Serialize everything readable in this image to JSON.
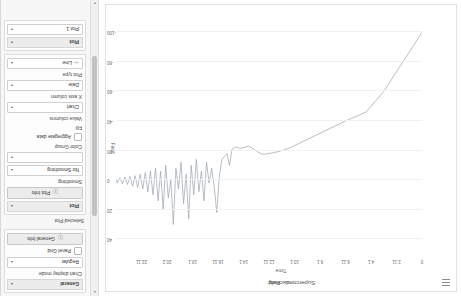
{
  "app": {
    "title": "Superconductivity"
  },
  "chart": {
    "menu_icon": "hamburger-menu-icon",
    "title": "Superconductivity",
    "legend": [
      {
        "label": "Field",
        "color": "#9aa3ad"
      }
    ],
    "xlabel": "Time",
    "ylabel": "Field"
  },
  "chart_data": {
    "type": "line",
    "title": "Superconductivity",
    "xlabel": "Time",
    "ylabel": "Field",
    "grid": true,
    "legend_position": "top-center",
    "series": [
      {
        "name": "Field",
        "color": "#9aa3ad",
        "points": [
          [
            0.0,
            -100.0
          ],
          [
            0.6,
            -92.0
          ],
          [
            1.2,
            -84.0
          ],
          [
            1.8,
            -76.0
          ],
          [
            2.4,
            -68.0
          ],
          [
            3.0,
            -60.0
          ],
          [
            3.6,
            -54.0
          ],
          [
            4.0,
            -50.0
          ],
          [
            4.4,
            -46.0
          ],
          [
            4.8,
            -44.5
          ],
          [
            5.2,
            -43.0
          ],
          [
            5.6,
            -41.5
          ],
          [
            6.0,
            -40.0
          ],
          [
            6.6,
            -37.5
          ],
          [
            7.2,
            -35.0
          ],
          [
            7.8,
            -32.5
          ],
          [
            8.4,
            -30.0
          ],
          [
            9.0,
            -27.5
          ],
          [
            9.6,
            -25.0
          ],
          [
            10.2,
            -22.5
          ],
          [
            10.8,
            -20.5
          ],
          [
            11.4,
            -19.0
          ],
          [
            12.0,
            -18.0
          ],
          [
            12.4,
            -17.5
          ],
          [
            12.8,
            -18.5
          ],
          [
            13.2,
            -21.0
          ],
          [
            13.6,
            -23.0
          ],
          [
            14.0,
            -22.0
          ],
          [
            14.3,
            -21.5
          ],
          [
            14.6,
            -22.5
          ],
          [
            14.9,
            -21.0
          ],
          [
            15.1,
            -10.0
          ],
          [
            15.3,
            -18.0
          ],
          [
            15.5,
            -16.0
          ],
          [
            15.7,
            -14.0
          ],
          [
            15.9,
            -2.0
          ],
          [
            16.1,
            22.0
          ],
          [
            16.3,
            4.0
          ],
          [
            16.5,
            -8.0
          ],
          [
            16.7,
            2.0
          ],
          [
            16.9,
            -12.0
          ],
          [
            17.1,
            14.0
          ],
          [
            17.3,
            -6.0
          ],
          [
            17.5,
            8.0
          ],
          [
            17.7,
            -14.0
          ],
          [
            17.9,
            10.0
          ],
          [
            18.1,
            -10.0
          ],
          [
            18.3,
            26.0
          ],
          [
            18.5,
            -4.0
          ],
          [
            18.7,
            16.0
          ],
          [
            18.9,
            -12.0
          ],
          [
            19.1,
            6.0
          ],
          [
            19.3,
            -8.0
          ],
          [
            19.5,
            30.0
          ],
          [
            19.7,
            0.0
          ],
          [
            19.9,
            12.0
          ],
          [
            20.1,
            -10.0
          ],
          [
            20.3,
            20.0
          ],
          [
            20.5,
            -6.0
          ],
          [
            20.7,
            14.0
          ],
          [
            20.9,
            -8.0
          ],
          [
            21.1,
            10.0
          ],
          [
            21.3,
            -6.0
          ],
          [
            21.5,
            8.0
          ],
          [
            21.7,
            -5.0
          ],
          [
            21.9,
            6.0
          ],
          [
            22.1,
            -4.0
          ],
          [
            22.3,
            5.0
          ],
          [
            22.5,
            -3.0
          ],
          [
            22.7,
            4.0
          ],
          [
            22.9,
            -2.5
          ],
          [
            23.1,
            3.0
          ],
          [
            23.3,
            -2.0
          ],
          [
            23.5,
            2.5
          ],
          [
            23.7,
            -1.5
          ],
          [
            23.9,
            2.0
          ],
          [
            24.0,
            -1.0
          ]
        ]
      }
    ],
    "xticks": [
      {
        "value": 0,
        "label": "0"
      },
      {
        "value": 2,
        "label": "2.11"
      },
      {
        "value": 4,
        "label": "4.1"
      },
      {
        "value": 6,
        "label": "6.11"
      },
      {
        "value": 8,
        "label": "8.1"
      },
      {
        "value": 10,
        "label": "10.1"
      },
      {
        "value": 12,
        "label": "12.11"
      },
      {
        "value": 14,
        "label": "14.1"
      },
      {
        "value": 16,
        "label": "16.11"
      },
      {
        "value": 18,
        "label": "18.1"
      },
      {
        "value": 20,
        "label": "20.2"
      },
      {
        "value": 22,
        "label": "22.11"
      }
    ],
    "yticks": [
      {
        "value": 40,
        "label": "40"
      },
      {
        "value": 20,
        "label": "20"
      },
      {
        "value": 0,
        "label": "0"
      },
      {
        "value": -20,
        "label": "-20"
      },
      {
        "value": -40,
        "label": "-40"
      },
      {
        "value": -60,
        "label": "-60"
      },
      {
        "value": -80,
        "label": "-80"
      },
      {
        "value": -100,
        "label": "-100"
      }
    ],
    "xlim": [
      0,
      24
    ],
    "ylim": [
      -105,
      48
    ]
  },
  "sidebar": {
    "panels": [
      {
        "key": "general",
        "title": "General",
        "collapse_icon": "chevron-up-icon",
        "fields": [
          {
            "key": "chart_display_mode_label",
            "label": "Chart display mode"
          },
          {
            "key": "chart_display_mode_value",
            "value": "Regular",
            "arrow": "▴"
          },
          {
            "key": "panel_grid",
            "label": "Panel Grid",
            "checked": false
          }
        ],
        "button": {
          "label": "General Info",
          "icon": "info-icon"
        }
      },
      {
        "key": "selected_plot",
        "title": "Selected Plot"
      },
      {
        "key": "plot_options",
        "title": "Plot",
        "collapse_icon": "chevron-up-icon",
        "fields": [
          {
            "key": "smoothing_label",
            "label": "Smoothing"
          },
          {
            "key": "smoothing_value",
            "value": "No Smoothing",
            "arrow": "▴"
          },
          {
            "key": "color_group_value",
            "value": "",
            "arrow": "▾"
          },
          {
            "key": "color_group_label",
            "label": "Color Group"
          },
          {
            "key": "aggregate_data",
            "label": "Aggregate data",
            "checked": false
          },
          {
            "key": "fill_label",
            "label": "Fill"
          },
          {
            "key": "value_columns_label",
            "label": "Value columns"
          },
          {
            "key": "value_columns_value",
            "value": "Chart",
            "arrow": "▾"
          },
          {
            "key": "x_axis_column_label",
            "label": "X axis column"
          },
          {
            "key": "x_axis_column_value",
            "value": "Date",
            "arrow": "▾"
          },
          {
            "key": "plot_type_label",
            "label": "Plot type"
          },
          {
            "key": "plot_type_value",
            "value": "Line",
            "icon": "line-chart-icon",
            "arrow": "▴"
          }
        ],
        "button": {
          "label": "Plot Info",
          "icon": "info-icon"
        }
      },
      {
        "key": "plot_selector",
        "title": "Plot",
        "collapse_icon": "chevron-down-icon",
        "fields": [
          {
            "key": "plot_1",
            "value": "Plot 1",
            "arrow": "▾"
          }
        ]
      }
    ]
  },
  "scrollbar": {
    "up_icon": "caret-up-icon",
    "down_icon": "caret-down-icon"
  }
}
